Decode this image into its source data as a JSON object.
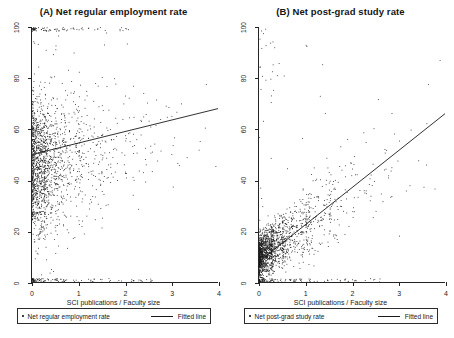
{
  "figure": {
    "width": 454,
    "height": 338,
    "background": "#ffffff",
    "ink_color": "#1a1a1a"
  },
  "panels": [
    {
      "id": "a",
      "title": "(A) Net regular employment rate",
      "xlabel": "SCI publications / Faculty size",
      "legend": {
        "marker_label": "Net regular employment rate",
        "line_label": "Fitted line"
      }
    },
    {
      "id": "b",
      "title": "(B) Net post-grad study rate",
      "xlabel": "SCI publications / Faculty size",
      "legend": {
        "marker_label": "Net post-grad study rate",
        "line_label": "Fitted line"
      }
    }
  ],
  "axis": {
    "xticks": [
      "0",
      "1",
      "2",
      "3",
      "4"
    ],
    "yticks": [
      "100",
      "80",
      "60",
      "40",
      "20",
      "0"
    ],
    "xlim": [
      0,
      4
    ],
    "ylim": [
      0,
      100
    ]
  },
  "chart_data": [
    {
      "type": "scatter",
      "panel": "(A)",
      "title": "(A) Net regular employment rate",
      "xlabel": "SCI publications / Faculty size",
      "ylabel": "Net regular employment rate",
      "xlim": [
        0,
        4
      ],
      "ylim": [
        0,
        100
      ],
      "xticks": [
        0,
        1,
        2,
        3,
        4
      ],
      "yticks": [
        0,
        20,
        40,
        60,
        80,
        100
      ],
      "grid": false,
      "legend_position": "below-axes",
      "marker": "dot",
      "n_points": 1700,
      "distribution_note": "Dense vertical band of observations concentrated between x=0 and x=0.5 spanning the full 0-100 range of y; point density thins rapidly as x increases, with sparse scatter out to x=4.",
      "fitted_line": {
        "label": "Fitted line",
        "x": [
          0,
          4
        ],
        "y": [
          50,
          68
        ],
        "intercept": 50,
        "slope": 4.5
      },
      "series": [
        {
          "name": "Net regular employment rate",
          "x_density": [
            {
              "x_bin": [
                0.0,
                0.25
              ],
              "share": 0.46
            },
            {
              "x_bin": [
                0.25,
                0.5
              ],
              "share": 0.21
            },
            {
              "x_bin": [
                0.5,
                1.0
              ],
              "share": 0.17
            },
            {
              "x_bin": [
                1.0,
                1.5
              ],
              "share": 0.08
            },
            {
              "x_bin": [
                1.5,
                2.0
              ],
              "share": 0.04
            },
            {
              "x_bin": [
                2.0,
                3.0
              ],
              "share": 0.03
            },
            {
              "x_bin": [
                3.0,
                4.0
              ],
              "share": 0.01
            }
          ],
          "y_spread": [
            0,
            100
          ],
          "y_mode": 45
        }
      ]
    },
    {
      "type": "scatter",
      "panel": "(B)",
      "title": "(B) Net post-grad study rate",
      "xlabel": "SCI publications / Faculty size",
      "ylabel": "Net post-grad study rate",
      "xlim": [
        0,
        4
      ],
      "ylim": [
        0,
        100
      ],
      "xticks": [
        0,
        1,
        2,
        3,
        4
      ],
      "yticks": [
        0,
        20,
        40,
        60,
        80,
        100
      ],
      "grid": false,
      "legend_position": "below-axes",
      "marker": "dot",
      "n_points": 1700,
      "distribution_note": "Very dense cluster near the origin with most observations below y=20; density decreases sharply with increasing y and x, a few outliers reach y=100.",
      "fitted_line": {
        "label": "Fitted line",
        "x": [
          0,
          4
        ],
        "y": [
          8,
          66
        ],
        "intercept": 8,
        "slope": 14.5
      },
      "series": [
        {
          "name": "Net post-grad study rate",
          "x_density": [
            {
              "x_bin": [
                0.0,
                0.25
              ],
              "share": 0.48
            },
            {
              "x_bin": [
                0.25,
                0.5
              ],
              "share": 0.2
            },
            {
              "x_bin": [
                0.5,
                1.0
              ],
              "share": 0.16
            },
            {
              "x_bin": [
                1.0,
                1.5
              ],
              "share": 0.08
            },
            {
              "x_bin": [
                1.5,
                2.0
              ],
              "share": 0.04
            },
            {
              "x_bin": [
                2.0,
                3.0
              ],
              "share": 0.03
            },
            {
              "x_bin": [
                3.0,
                4.0
              ],
              "share": 0.01
            }
          ],
          "y_spread": [
            0,
            100
          ],
          "y_mode": 10
        }
      ]
    }
  ]
}
